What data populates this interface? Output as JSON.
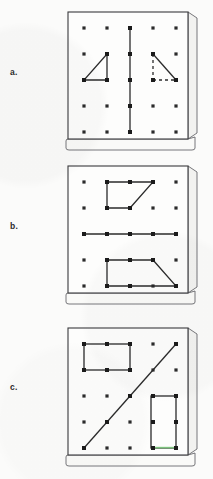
{
  "figure": {
    "kind": "geoboard-worksheet",
    "background_color": "#fbfbfa",
    "ink_color": "#2b2b2b",
    "board_face_color": "#fdfdfc",
    "board_side_color": "#f2f2f0",
    "highlight_color": "#7fd07f",
    "grid": {
      "rows": 5,
      "cols": 5
    }
  },
  "panels": [
    {
      "label": "a.",
      "board_name": "geoboard-a",
      "figures": [
        {
          "name": "right-triangle-solid",
          "style": "solid",
          "vertices": [
            [
              1,
              2
            ],
            [
              1,
              3
            ],
            [
              0,
              3
            ]
          ]
        },
        {
          "name": "right-triangle-dashed",
          "style": "mixed",
          "vertices": [
            [
              3,
              2
            ],
            [
              4,
              3
            ],
            [
              3,
              3
            ]
          ]
        },
        {
          "name": "vertical-segment",
          "style": "solid",
          "vertices": [
            [
              2,
              0
            ],
            [
              2,
              4
            ]
          ]
        }
      ]
    },
    {
      "label": "b.",
      "board_name": "geoboard-b",
      "figures": [
        {
          "name": "trapezoid-top",
          "style": "solid",
          "vertices": [
            [
              1,
              0
            ],
            [
              3,
              0
            ],
            [
              2,
              1
            ],
            [
              1,
              1
            ]
          ]
        },
        {
          "name": "horizontal-segment",
          "style": "solid",
          "vertices": [
            [
              0,
              2
            ],
            [
              4,
              2
            ]
          ]
        },
        {
          "name": "trapezoid-bottom",
          "style": "solid",
          "vertices": [
            [
              1,
              3
            ],
            [
              3,
              3
            ],
            [
              4,
              4
            ],
            [
              1,
              4
            ]
          ]
        }
      ]
    },
    {
      "label": "c.",
      "board_name": "geoboard-c",
      "figures": [
        {
          "name": "rectangle-horizontal",
          "style": "solid",
          "vertices": [
            [
              0,
              0
            ],
            [
              2,
              0
            ],
            [
              2,
              1
            ],
            [
              0,
              1
            ]
          ]
        },
        {
          "name": "diagonal-segment",
          "style": "solid",
          "vertices": [
            [
              0,
              4
            ],
            [
              4,
              0
            ]
          ]
        },
        {
          "name": "rectangle-vertical",
          "style": "solid",
          "vertices": [
            [
              3,
              2
            ],
            [
              4,
              2
            ],
            [
              4,
              4
            ],
            [
              3,
              4
            ]
          ]
        }
      ]
    }
  ]
}
